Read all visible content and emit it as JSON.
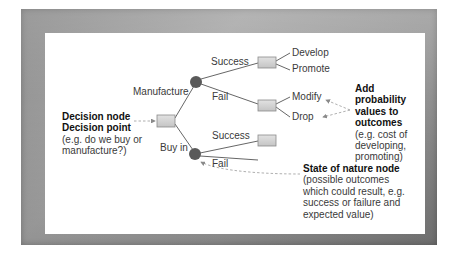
{
  "diagram": {
    "type": "decision-tree",
    "colors": {
      "frame": "#9a9a9a",
      "background": "#ffffff",
      "decision_box_fill": "#d6d6d6",
      "chance_node_fill": "#5a5a5a",
      "line": "#555555",
      "dashed_arrow": "#9a9a9a"
    },
    "branches": {
      "manufacture": "Manufacture",
      "buy_in": "Buy in",
      "manufacture_success": "Success",
      "manufacture_fail": "Fail",
      "buy_success": "Success",
      "buy_fail": "Fail"
    },
    "outcomes": {
      "develop": "Develop",
      "promote": "Promote",
      "modify": "Modify",
      "drop": "Drop"
    },
    "annotations": {
      "decision": {
        "title1": "Decision node",
        "title2": "Decision point",
        "line1": "(e.g. do we buy or",
        "line2": "manufacture?)"
      },
      "probability": {
        "title1": "Add",
        "title2": "probability",
        "title3": "values to",
        "title4": "outcomes",
        "line1": "(e.g. cost of",
        "line2": "developing,",
        "line3": "promoting)"
      },
      "state_of_nature": {
        "title": "State of nature node",
        "line1": "(possible outcomes",
        "line2": "which could result, e.g.",
        "line3": "success or failure and",
        "line4": "expected value)"
      }
    }
  }
}
